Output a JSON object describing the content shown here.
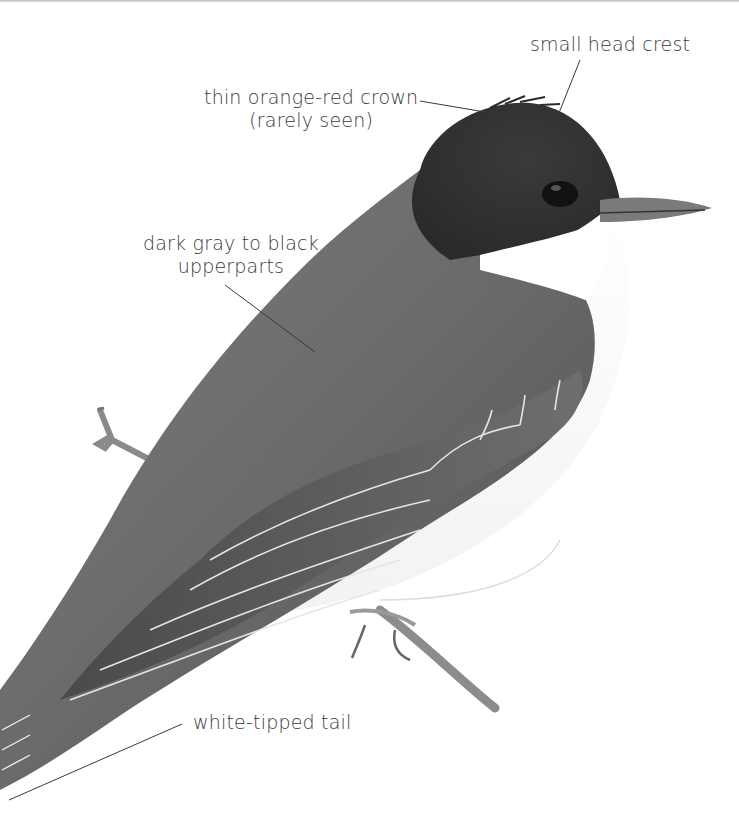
{
  "figure": {
    "background": "#ffffff",
    "ink_color": "#3a3a3a"
  },
  "annotations": [
    {
      "id": "crest",
      "lines": [
        "small head crest"
      ]
    },
    {
      "id": "crown",
      "lines": [
        "thin orange-red crown",
        "(rarely seen)"
      ]
    },
    {
      "id": "upperparts",
      "lines": [
        "dark gray to black",
        "upperparts"
      ]
    },
    {
      "id": "tail",
      "lines": [
        "white-tipped tail"
      ]
    }
  ]
}
